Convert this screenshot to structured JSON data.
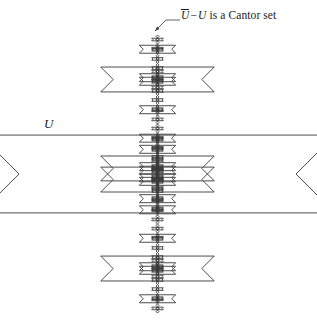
{
  "figure": {
    "type": "fractal-diagram",
    "canvas": {
      "width": 317,
      "height": 334
    },
    "stroke_color": "#3a3a3a",
    "background_color": "#ffffff",
    "text_color": "#1c1c1c",
    "main_diamond": {
      "left_vertex": [
        19,
        174
      ],
      "right_vertex": [
        296,
        174
      ],
      "top_apex": [
        158,
        35
      ],
      "bottom_apex": [
        158,
        313
      ],
      "half_width": 138.5,
      "half_height": 139
    },
    "recursion": {
      "depth": 4,
      "child_scale": 0.32,
      "children_per_apex": 2,
      "notch_at": [
        "top-apex",
        "bottom-apex"
      ]
    }
  },
  "labels": {
    "region": {
      "text": "U",
      "x": 44,
      "y": 116,
      "style": "italic"
    },
    "cantor": {
      "closure": "U",
      "operator": "−",
      "subtrahend": "U",
      "predicate": "is a Cantor set",
      "full_text": "Ū − U is a Cantor set",
      "x": 181,
      "y": 9
    }
  },
  "leader": {
    "name": "arrow-to-top-fractal",
    "tip": [
      155,
      31
    ],
    "elbow": [
      166,
      20
    ],
    "end": [
      180,
      20
    ]
  }
}
